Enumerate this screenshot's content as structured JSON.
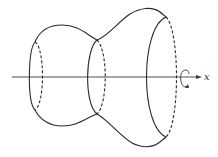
{
  "figure": {
    "axis": {
      "label": "x",
      "rotation_indicator": "rotation-arrow"
    },
    "cross_sections": [
      {
        "name": "left",
        "front": "solid",
        "back": "dashed"
      },
      {
        "name": "middle",
        "front": "solid",
        "back": "dashed"
      },
      {
        "name": "right",
        "front": "solid",
        "back": "dashed"
      }
    ],
    "colors": {
      "stroke": "#2a2a2a",
      "background": "#ffffff"
    }
  }
}
